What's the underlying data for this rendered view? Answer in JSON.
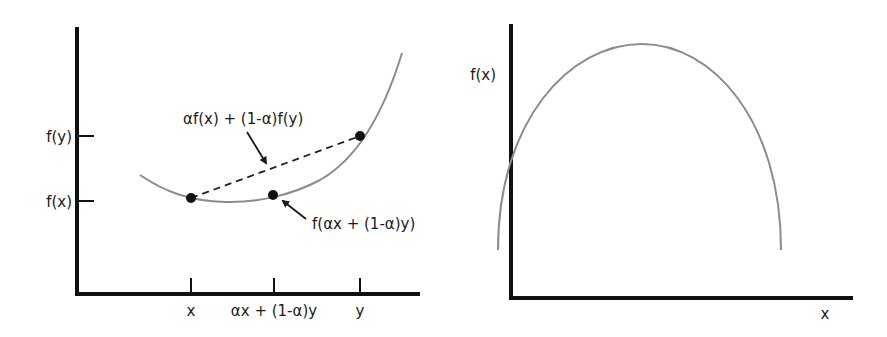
{
  "left_diagram": {
    "title": "Convex function",
    "y_tick_labels": [
      "f(y)",
      "f(x)"
    ],
    "x_tick_labels": [
      "x",
      "αx + (1-α)y",
      "y"
    ],
    "annotations": {
      "chord_label": "αf(x) + (1-α)f(y)",
      "curve_point_label": "f(αx + (1-α)y)"
    }
  },
  "right_diagram": {
    "title": "Concave function",
    "y_axis_label": "f(x)",
    "x_axis_label": "x"
  },
  "colors": {
    "axis": "#111111",
    "curve": "#8c8c8c",
    "point": "#111111",
    "text": "#1a1a1a"
  }
}
